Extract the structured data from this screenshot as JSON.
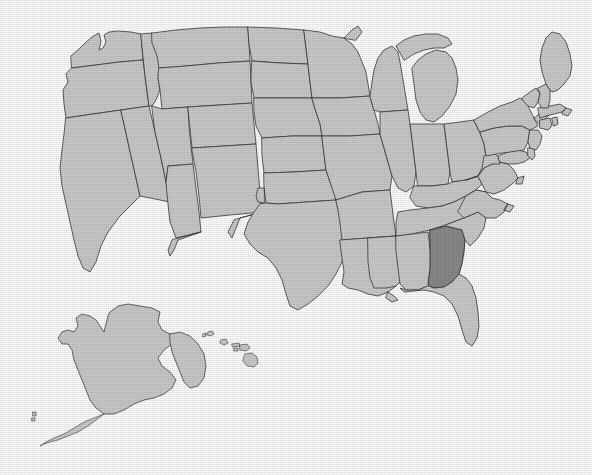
{
  "figure": {
    "kind": "choropleth-locator-map",
    "accessible_title": "Map of the United States with one state shaded darker",
    "background_color": "#ffffff",
    "has_title_text": false,
    "has_legend": false,
    "has_axis_labels": false,
    "has_state_labels": false,
    "width_px": 592,
    "height_px": 475
  },
  "styles": {
    "state_fill": "#cccccc",
    "state_border": "#3a3a3a",
    "highlight_fill": "#8a8a8a",
    "highlight_border": "#2a2a2a",
    "water_fill": "#ffffff"
  },
  "highlight": {
    "state_name": "Georgia",
    "state_code": "GA",
    "fill": "#8a8a8a",
    "count": 1
  },
  "insets": [
    {
      "id": "alaska",
      "label": "Alaska"
    },
    {
      "id": "hawaii",
      "label": "Hawaii"
    }
  ],
  "states": [
    {
      "code": "WA",
      "name": "Washington",
      "highlighted": false
    },
    {
      "code": "OR",
      "name": "Oregon",
      "highlighted": false
    },
    {
      "code": "CA",
      "name": "California",
      "highlighted": false
    },
    {
      "code": "NV",
      "name": "Nevada",
      "highlighted": false
    },
    {
      "code": "ID",
      "name": "Idaho",
      "highlighted": false
    },
    {
      "code": "MT",
      "name": "Montana",
      "highlighted": false
    },
    {
      "code": "WY",
      "name": "Wyoming",
      "highlighted": false
    },
    {
      "code": "UT",
      "name": "Utah",
      "highlighted": false
    },
    {
      "code": "AZ",
      "name": "Arizona",
      "highlighted": false
    },
    {
      "code": "CO",
      "name": "Colorado",
      "highlighted": false
    },
    {
      "code": "NM",
      "name": "New Mexico",
      "highlighted": false
    },
    {
      "code": "ND",
      "name": "North Dakota",
      "highlighted": false
    },
    {
      "code": "SD",
      "name": "South Dakota",
      "highlighted": false
    },
    {
      "code": "NE",
      "name": "Nebraska",
      "highlighted": false
    },
    {
      "code": "KS",
      "name": "Kansas",
      "highlighted": false
    },
    {
      "code": "OK",
      "name": "Oklahoma",
      "highlighted": false
    },
    {
      "code": "TX",
      "name": "Texas",
      "highlighted": false
    },
    {
      "code": "MN",
      "name": "Minnesota",
      "highlighted": false
    },
    {
      "code": "IA",
      "name": "Iowa",
      "highlighted": false
    },
    {
      "code": "MO",
      "name": "Missouri",
      "highlighted": false
    },
    {
      "code": "AR",
      "name": "Arkansas",
      "highlighted": false
    },
    {
      "code": "LA",
      "name": "Louisiana",
      "highlighted": false
    },
    {
      "code": "WI",
      "name": "Wisconsin",
      "highlighted": false
    },
    {
      "code": "IL",
      "name": "Illinois",
      "highlighted": false
    },
    {
      "code": "MI",
      "name": "Michigan",
      "highlighted": false
    },
    {
      "code": "IN",
      "name": "Indiana",
      "highlighted": false
    },
    {
      "code": "OH",
      "name": "Ohio",
      "highlighted": false
    },
    {
      "code": "KY",
      "name": "Kentucky",
      "highlighted": false
    },
    {
      "code": "TN",
      "name": "Tennessee",
      "highlighted": false
    },
    {
      "code": "MS",
      "name": "Mississippi",
      "highlighted": false
    },
    {
      "code": "AL",
      "name": "Alabama",
      "highlighted": false
    },
    {
      "code": "GA",
      "name": "Georgia",
      "highlighted": true
    },
    {
      "code": "FL",
      "name": "Florida",
      "highlighted": false
    },
    {
      "code": "SC",
      "name": "South Carolina",
      "highlighted": false
    },
    {
      "code": "NC",
      "name": "North Carolina",
      "highlighted": false
    },
    {
      "code": "VA",
      "name": "Virginia",
      "highlighted": false
    },
    {
      "code": "WV",
      "name": "West Virginia",
      "highlighted": false
    },
    {
      "code": "MD",
      "name": "Maryland",
      "highlighted": false
    },
    {
      "code": "DE",
      "name": "Delaware",
      "highlighted": false
    },
    {
      "code": "PA",
      "name": "Pennsylvania",
      "highlighted": false
    },
    {
      "code": "NJ",
      "name": "New Jersey",
      "highlighted": false
    },
    {
      "code": "NY",
      "name": "New York",
      "highlighted": false
    },
    {
      "code": "CT",
      "name": "Connecticut",
      "highlighted": false
    },
    {
      "code": "RI",
      "name": "Rhode Island",
      "highlighted": false
    },
    {
      "code": "MA",
      "name": "Massachusetts",
      "highlighted": false
    },
    {
      "code": "VT",
      "name": "Vermont",
      "highlighted": false
    },
    {
      "code": "NH",
      "name": "New Hampshire",
      "highlighted": false
    },
    {
      "code": "ME",
      "name": "Maine",
      "highlighted": false
    },
    {
      "code": "AK",
      "name": "Alaska",
      "highlighted": false
    },
    {
      "code": "HI",
      "name": "Hawaii",
      "highlighted": false
    }
  ]
}
